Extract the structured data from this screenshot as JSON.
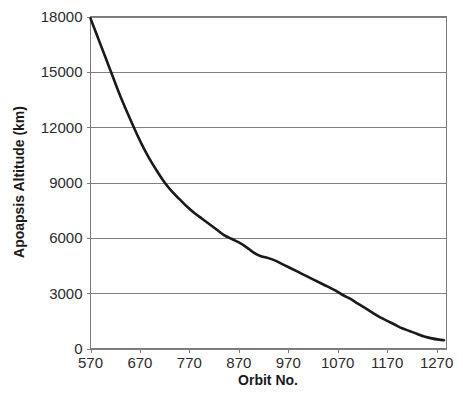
{
  "chart_data": {
    "type": "line",
    "title": "",
    "xlabel": "Orbit No.",
    "ylabel": "Apoapsis Altitude (km)",
    "xlim": [
      570,
      1290
    ],
    "ylim": [
      0,
      18000
    ],
    "xticks": [
      570,
      670,
      770,
      870,
      970,
      1070,
      1170,
      1270
    ],
    "yticks": [
      0,
      3000,
      6000,
      9000,
      12000,
      15000,
      18000
    ],
    "xtick_labels": [
      "570",
      "670",
      "770",
      "870",
      "970",
      "1070",
      "1170",
      "1270"
    ],
    "ytick_labels": [
      "0",
      "3000",
      "6000",
      "9000",
      "12000",
      "15000",
      "18000"
    ],
    "grid": "horizontal",
    "legend": "none",
    "line_color": "#1a1a1a",
    "grid_color": "#808080",
    "series": [
      {
        "name": "Apoapsis Altitude",
        "x": [
          570,
          585,
          600,
          615,
          630,
          645,
          660,
          675,
          690,
          705,
          720,
          735,
          750,
          765,
          780,
          795,
          810,
          825,
          840,
          855,
          870,
          885,
          900,
          915,
          930,
          945,
          960,
          975,
          990,
          1005,
          1020,
          1035,
          1050,
          1065,
          1080,
          1095,
          1110,
          1125,
          1140,
          1155,
          1170,
          1185,
          1200,
          1215,
          1230,
          1245,
          1260,
          1275,
          1285
        ],
        "y": [
          17900,
          16850,
          15800,
          14750,
          13700,
          12750,
          11850,
          11000,
          10250,
          9600,
          9000,
          8500,
          8100,
          7700,
          7350,
          7050,
          6750,
          6450,
          6150,
          5950,
          5750,
          5500,
          5200,
          5000,
          4900,
          4750,
          4550,
          4350,
          4150,
          3950,
          3750,
          3550,
          3350,
          3150,
          2900,
          2700,
          2450,
          2200,
          1950,
          1700,
          1500,
          1300,
          1100,
          950,
          800,
          650,
          550,
          480,
          450
        ]
      }
    ]
  },
  "axes": {
    "y_title": "Apoapsis Altitude (km)",
    "x_title": "Orbit No."
  }
}
